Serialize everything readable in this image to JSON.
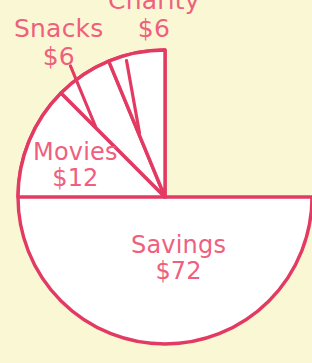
{
  "chart_data": {
    "type": "pie",
    "title": "",
    "subtitle": "",
    "xlabel": "",
    "ylabel": "",
    "legend_position": "none",
    "grid": false,
    "currency": "$",
    "total": 96,
    "center": {
      "x": 165,
      "y": 197
    },
    "radius": 147,
    "start_angle_deg": 90,
    "direction": "counterclockwise",
    "colors": {
      "background": "#faf8d4",
      "slice_fill": "#ffffff",
      "stroke": "#e33a63",
      "label_text": "#ef5f7e"
    },
    "categories": [
      "Savings",
      "Movies",
      "Snacks",
      "Charity"
    ],
    "values": [
      72,
      12,
      6,
      6
    ],
    "slices": [
      {
        "name": "Savings",
        "value": 72,
        "value_label": "$72",
        "percent": 75,
        "angle_deg": 270,
        "start_deg": 90,
        "end_deg": 360,
        "label_placement": "inside"
      },
      {
        "name": "Movies",
        "value": 12,
        "value_label": "$12",
        "percent": 12.5,
        "angle_deg": 45,
        "start_deg": 135,
        "end_deg": 180,
        "label_placement": "inside"
      },
      {
        "name": "Snacks",
        "value": 6,
        "value_label": "$6",
        "percent": 6.25,
        "angle_deg": 22.5,
        "start_deg": 112.5,
        "end_deg": 135,
        "label_placement": "outside-leader"
      },
      {
        "name": "Charity",
        "value": 6,
        "value_label": "$6",
        "percent": 6.25,
        "angle_deg": 22.5,
        "start_deg": 90,
        "end_deg": 112.5,
        "label_placement": "outside-leader"
      }
    ]
  },
  "labels": {
    "charity": {
      "name": "Charity",
      "value": "$6"
    },
    "snacks": {
      "name": "Snacks",
      "value": "$6"
    },
    "movies": {
      "name": "Movies",
      "value": "$12"
    },
    "savings": {
      "name": "Savings",
      "value": "$72"
    }
  }
}
